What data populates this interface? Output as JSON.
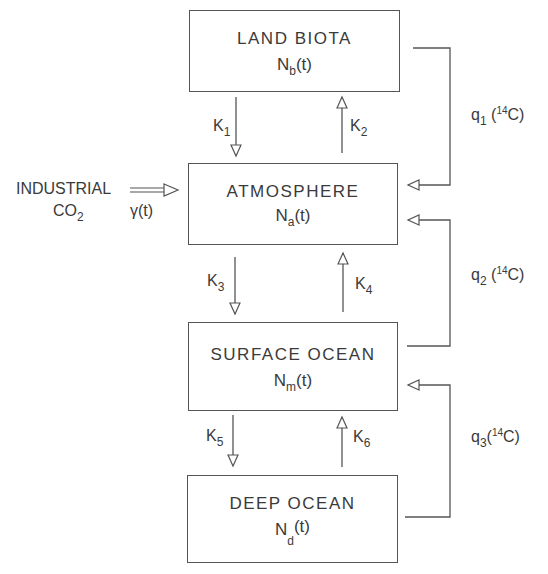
{
  "diagram": {
    "reservoirs": [
      {
        "id": "land_biota",
        "title": "LAND BIOTA",
        "var_base": "N",
        "var_sub": "b",
        "var_arg": "(t)"
      },
      {
        "id": "atmosphere",
        "title": "ATMOSPHERE",
        "var_base": "N",
        "var_sub": "a",
        "var_arg": "(t)"
      },
      {
        "id": "surface_ocean",
        "title": "SURFACE OCEAN",
        "var_base": "N",
        "var_sub": "m",
        "var_arg": "(t)"
      },
      {
        "id": "deep_ocean",
        "title": "DEEP OCEAN",
        "var_base": "N",
        "var_sub": "d",
        "var_arg": "(t)"
      }
    ],
    "exchange_coefficients": [
      {
        "base": "K",
        "sub": "1",
        "from": "land_biota",
        "to": "atmosphere"
      },
      {
        "base": "K",
        "sub": "2",
        "from": "atmosphere",
        "to": "land_biota"
      },
      {
        "base": "K",
        "sub": "3",
        "from": "atmosphere",
        "to": "surface_ocean"
      },
      {
        "base": "K",
        "sub": "4",
        "from": "surface_ocean",
        "to": "atmosphere"
      },
      {
        "base": "K",
        "sub": "5",
        "from": "surface_ocean",
        "to": "deep_ocean"
      },
      {
        "base": "K",
        "sub": "6",
        "from": "deep_ocean",
        "to": "surface_ocean"
      }
    ],
    "isotope_fluxes": [
      {
        "base": "q",
        "sub": "1",
        "isotope_mass": "14",
        "isotope_elem": "C",
        "from": "land_biota",
        "to": "atmosphere"
      },
      {
        "base": "q",
        "sub": "2",
        "isotope_mass": "14",
        "isotope_elem": "C",
        "from": "surface_ocean",
        "to": "atmosphere"
      },
      {
        "base": "q",
        "sub": "3",
        "isotope_mass": "14",
        "isotope_elem": "C",
        "from": "deep_ocean",
        "to": "surface_ocean"
      }
    ],
    "source": {
      "line1": "INDUSTRIAL",
      "line2_base": "CO",
      "line2_sub": "2",
      "rate": "γ(t)",
      "to": "atmosphere"
    },
    "colors": {
      "line": "#555555",
      "text": "#3a3a3a",
      "background": "#ffffff"
    }
  }
}
